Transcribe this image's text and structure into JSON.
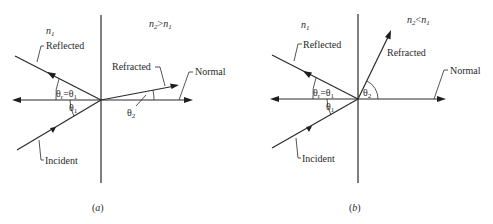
{
  "figure": {
    "panels": [
      {
        "id": "a",
        "caption_letter": "a",
        "medium_left": {
          "base": "n",
          "sub": "1"
        },
        "medium_right": {
          "base": "n",
          "sub": "2",
          "relation": ">",
          "base2": "n",
          "sub2": "1"
        },
        "labels": {
          "reflected": "Reflected",
          "refracted": "Refracted",
          "normal": "Normal",
          "incident": "Incident"
        },
        "angles": {
          "reflection": {
            "base": "θ",
            "sub": "r",
            "eq": "=θ",
            "sub2": "1"
          },
          "incidence": {
            "base": "θ",
            "sub": "1"
          },
          "refraction": {
            "base": "θ",
            "sub": "2"
          }
        }
      },
      {
        "id": "b",
        "caption_letter": "b",
        "medium_left": {
          "base": "n",
          "sub": "1"
        },
        "medium_right": {
          "base": "n",
          "sub": "2",
          "relation": "<",
          "base2": "n",
          "sub2": "1"
        },
        "labels": {
          "reflected": "Reflected",
          "refracted": "Refracted",
          "normal": "Normal",
          "incident": "Incident"
        },
        "angles": {
          "reflection": {
            "base": "θ",
            "sub": "r",
            "eq": "=θ",
            "sub2": "1"
          },
          "incidence": {
            "base": "θ",
            "sub": "1"
          },
          "refraction": {
            "base": "θ",
            "sub": "2"
          }
        }
      }
    ],
    "caption_paren_open": "(",
    "caption_paren_close": ")",
    "stroke_color": "#2a2a2a",
    "background": "#ffffff"
  }
}
